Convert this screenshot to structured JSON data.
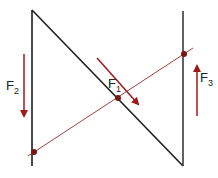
{
  "diagram": {
    "colors": {
      "structure": "#1e1e1e",
      "force": "#a01818",
      "line_of_action": "#a0413a",
      "background": "#ffffff"
    },
    "forces": [
      {
        "id": "F1",
        "label": "F",
        "subscript": "1",
        "direction": "down-right, along diagonal"
      },
      {
        "id": "F2",
        "label": "F",
        "subscript": "2",
        "direction": "down"
      },
      {
        "id": "F3",
        "label": "F",
        "subscript": "3",
        "direction": "up"
      }
    ],
    "points": {
      "left_bar_top": [
        32,
        10
      ],
      "left_bar_bottom": [
        32,
        166
      ],
      "right_bar_top": [
        183,
        11
      ],
      "right_bar_bottom": [
        183,
        166
      ],
      "left_dot": [
        34,
        152
      ],
      "center_dot": [
        118,
        98
      ],
      "right_dot": [
        184,
        54
      ]
    }
  }
}
